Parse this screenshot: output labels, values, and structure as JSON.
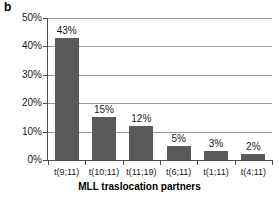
{
  "panel": {
    "label": "b"
  },
  "chart_data": {
    "type": "bar",
    "title": "",
    "subtitle": "",
    "xlabel": "MLL traslocation partners",
    "ylabel": "",
    "categories": [
      "t(9;11)",
      "t(10;11)",
      "t(11;19)",
      "t(6;11)",
      "t(1;11)",
      "t(4;11)"
    ],
    "values": [
      43,
      15,
      12,
      5,
      3,
      2
    ],
    "data_labels": [
      "43%",
      "15%",
      "12%",
      "5%",
      "3%",
      "2%"
    ],
    "ylim": [
      0,
      50
    ],
    "ytick_values": [
      0,
      10,
      20,
      30,
      40,
      50
    ],
    "ytick_labels": [
      "0%",
      "10%",
      "20%",
      "30%",
      "40%",
      "50%"
    ],
    "grid": true,
    "grid_axis": "y",
    "legend": false,
    "legend_position": "none",
    "bar_color": "#595959",
    "axis_color": "#4d4d4d",
    "grid_color": "#9a9a9a",
    "background_color": "#ffffff",
    "text_color": "#1a1a1a"
  }
}
